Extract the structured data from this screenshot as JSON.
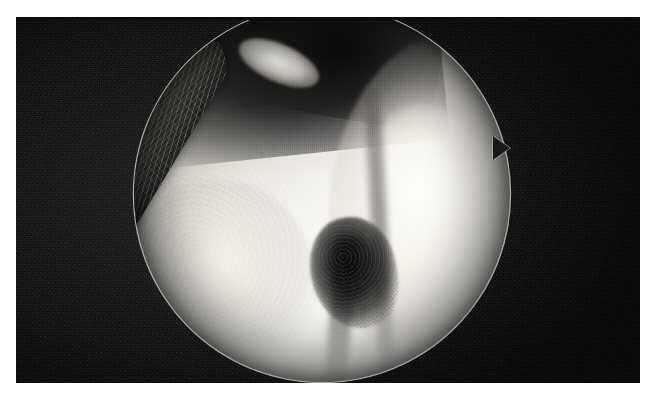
{
  "document": {
    "kind": "medical-photograph",
    "modality": "endoscopy",
    "color_mode": "grayscale",
    "page_background": "#ffffff",
    "has_text": false,
    "caption": ""
  },
  "figure": {
    "name": "endoscopic-view",
    "panel": {
      "x": 16,
      "y": 17,
      "width": 624,
      "height": 366,
      "background_color": "#0b0b0b",
      "description": "Black matte surround with fine film grain"
    },
    "scope_circle": {
      "center_x": 322,
      "center_y": 194,
      "radius": 188,
      "rim_color": "#e6e6e6",
      "clipped_edge": "top",
      "notch": {
        "name": "rim-notch",
        "x": 509,
        "y": 148,
        "description": "Small triangular spike interrupting the right rim"
      }
    },
    "regions": [
      {
        "name": "tendon-band",
        "label": "Diagonal fibrous band",
        "orientation_deg": 31,
        "tone": "mid-dark",
        "description": "Striated tubular structure crossing from upper-left to lower-centre"
      },
      {
        "name": "oval-highlight",
        "label": "Bright oval reflection",
        "tone": "bright",
        "description": "Elongated specular highlight in the upper middle of the field"
      },
      {
        "name": "dark-lesion",
        "label": "Dark cavity",
        "tone": "near-black",
        "description": "Irregular dark depression at the lower centre"
      },
      {
        "name": "bright-right-tissue",
        "label": "Smooth bright tissue",
        "tone": "very-bright",
        "description": "Broad smooth highly reflective surface filling the right half"
      },
      {
        "name": "granular-left-tissue",
        "label": "Granular tissue",
        "tone": "bright-textured",
        "description": "Coarse granular tissue in the lower-left quadrant"
      },
      {
        "name": "dark-upper-field",
        "label": "Shadowed recess",
        "tone": "dark",
        "description": "Under-illuminated recess across the top of the field"
      }
    ],
    "palette": {
      "matte": "#0b0b0b",
      "rim": "#e6e6e6",
      "highlight": "#f8f6f0",
      "midtone": "#9d978e",
      "shadow": "#141413"
    }
  }
}
